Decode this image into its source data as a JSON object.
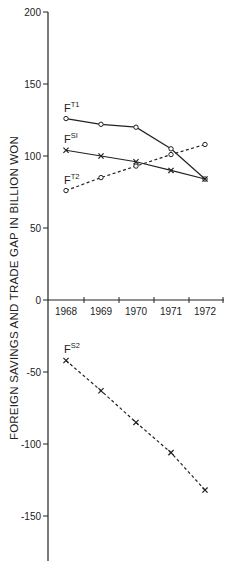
{
  "chart_data": {
    "type": "line",
    "title": "",
    "xlabel": "",
    "ylabel": "FOREIGN SAVINGS AND TRADE GAP IN BILLION WON",
    "categories": [
      "1968",
      "1969",
      "1970",
      "1971",
      "1972"
    ],
    "ylim": [
      -180,
      200
    ],
    "yticks": [
      200,
      150,
      100,
      50,
      0,
      -50,
      -100,
      -150
    ],
    "ytick_labels": [
      "200",
      "150",
      "100",
      "50",
      "0",
      "-50",
      "-100",
      "-150"
    ],
    "grid": false,
    "legend": "inline labels next to first data point",
    "series": [
      {
        "name": "F^T1",
        "base": "F",
        "sup": "T1",
        "style": "solid",
        "marker": "circle",
        "values": [
          126,
          122,
          120,
          105,
          84
        ]
      },
      {
        "name": "F^S1",
        "base": "F",
        "sup": "SI",
        "style": "solid",
        "marker": "x",
        "values": [
          104,
          100,
          96,
          90,
          84
        ]
      },
      {
        "name": "F^T2",
        "base": "F",
        "sup": "T2",
        "style": "dashed",
        "marker": "circle",
        "values": [
          76,
          85,
          93,
          101,
          108
        ]
      },
      {
        "name": "F^S2",
        "base": "F",
        "sup": "S2",
        "style": "dashed",
        "marker": "x",
        "values": [
          -42,
          -63,
          -85,
          -106,
          -132
        ]
      }
    ]
  },
  "colors": {
    "ink": "#222222",
    "background": "#ffffff"
  }
}
